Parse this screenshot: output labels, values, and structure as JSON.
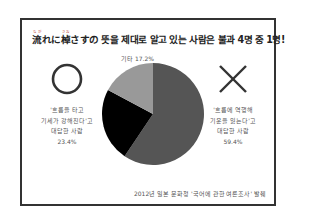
{
  "title": {
    "prefix_word1": "流",
    "ruby1": "なが",
    "middle": "れに",
    "prefix_word2": "棹",
    "ruby2": "さお",
    "rest": "さすの 뜻을 제대로 알고 있는 사람은 불과 4명 중 1명!"
  },
  "labels": {
    "other": "기타 17.2%",
    "left_line1": "'흐름을 타고",
    "left_line2": "기세가 강해진다'고",
    "left_line3": "대답한 사람",
    "left_pct": "23.4%",
    "right_line1": "'흐름에 역행해",
    "right_line2": "기운을 잃는다'고",
    "right_line3": "대답한 사람",
    "right_pct": "59.4%",
    "left_symbol": "circle-o",
    "right_symbol": "cross-x"
  },
  "source": "2012년 일본 문화청 '국어에 관한 여론조사' 발췌",
  "colors": {
    "correct_slice": "#000000",
    "wrong_slice": "#555555",
    "other_slice": "#999999",
    "frame": "#333333"
  },
  "chart_data": {
    "type": "pie",
    "categories": [
      "'흐름에 역행해 기운을 잃는다'고 대답한 사람",
      "'흐름을 타고 기세가 강해진다'고 대답한 사람",
      "기타"
    ],
    "values": [
      59.4,
      23.4,
      17.2
    ],
    "colors": [
      "#555555",
      "#000000",
      "#999999"
    ],
    "start_angle": "12 o'clock, clockwise",
    "source": "2012년 일본 문화청 '국어에 관한 여론조사' 발췌",
    "legend": "none (labels placed beside chart)"
  }
}
